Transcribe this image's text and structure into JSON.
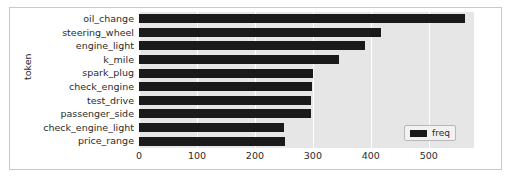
{
  "figure": {
    "background_color": "#ffffff",
    "frame_color": "#c9c9c9",
    "axes_background_color": "#e6e6e6",
    "grid_color": "#ffffff",
    "bar_color": "#1a1a1a"
  },
  "legend": {
    "label": "freq",
    "swatch_color": "#1a1a1a",
    "position": "lower right"
  },
  "chart_data": {
    "type": "bar",
    "orientation": "horizontal",
    "title": "",
    "xlabel": "",
    "ylabel": "token",
    "categories": [
      "oil_change",
      "steering_wheel",
      "engine_light",
      "k_mile",
      "spark_plug",
      "check_engine",
      "test_drive",
      "passenger_side",
      "check_engine_light",
      "price_range"
    ],
    "series": [
      {
        "name": "freq",
        "values": [
          562,
          417,
          390,
          345,
          300,
          298,
          297,
          297,
          251,
          252
        ]
      }
    ],
    "xlim": [
      0,
      578
    ],
    "xticks": [
      0,
      100,
      200,
      300,
      400,
      500
    ],
    "xtick_labels": [
      "0",
      "100",
      "200",
      "300",
      "400",
      "500"
    ],
    "grid": true,
    "grid_axis": "x",
    "legend_position": "lower right"
  }
}
